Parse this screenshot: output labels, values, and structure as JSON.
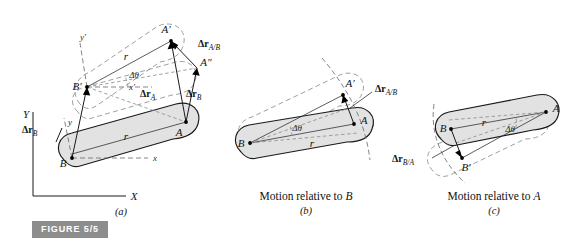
{
  "figure": {
    "badge_label": "FIGURE 5/5",
    "badge_color": "#8d8d8d",
    "body_fill_color": "#e2e2e2",
    "outline_color": "#1a1a1a",
    "ghost_color": "#8e8e8e"
  },
  "panels": {
    "a": {
      "letter": "(a)",
      "caption": "",
      "labels": {
        "point_A": "A",
        "point_B": "B",
        "point_A_prime": "A′",
        "point_A_double_prime": "A″",
        "point_B_prime": "B′",
        "axis_X": "X",
        "axis_Y": "Y",
        "axis_x": "x",
        "axis_y": "y",
        "axis_x_prime": "x′",
        "axis_y_prime": "y′",
        "r_lower": "r",
        "r_upper": "r",
        "delta_theta": "Δθ",
        "vec_dr_A": "Δr",
        "vec_dr_A_sub": "A",
        "vec_dr_B": "Δr",
        "vec_dr_B_sub": "B",
        "vec_dr_B_axis": "Δr",
        "vec_dr_B_axis_sub": "B",
        "vec_dr_AB": "Δr",
        "vec_dr_AB_sub": "A/B"
      }
    },
    "b": {
      "letter": "(b)",
      "caption_prefix": "Motion relative to ",
      "caption_point": "B",
      "labels": {
        "point_A": "A",
        "point_B": "B",
        "point_A_prime": "A′",
        "r": "r",
        "delta_theta": "Δθ",
        "vec_dr_AB": "Δr",
        "vec_dr_AB_sub": "A/B"
      }
    },
    "c": {
      "letter": "(c)",
      "caption_prefix": "Motion relative to ",
      "caption_point": "A",
      "labels": {
        "point_A": "A",
        "point_B": "B",
        "point_B_prime": "B′",
        "r": "r",
        "delta_theta": "Δθ",
        "vec_dr_BA": "Δr",
        "vec_dr_BA_sub": "B/A"
      }
    }
  }
}
